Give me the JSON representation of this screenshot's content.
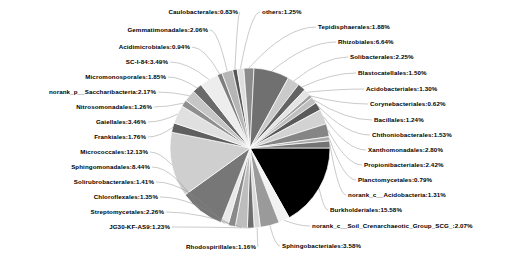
{
  "chart_data": {
    "type": "pie",
    "title": "",
    "subtitle": "",
    "xlabel": "",
    "ylabel": "",
    "legend_position": "none",
    "grid": false,
    "value_unit": "%",
    "start_angle_deg": 0,
    "direction": "clockwise",
    "palette": "grayscale",
    "categories": [
      "Burkholderiales",
      "norank_c__Soil_Crenarchaeotic_Group_SCG_",
      "Sphingobacteriales",
      "Rhodospirillales",
      "JG30-KF-AS9",
      "Streptomycetales",
      "Chloroflexales",
      "Solirubrobacterales",
      "Sphingomonadales",
      "Micrococcales",
      "Frankiales",
      "Gaiellales",
      "Nitrosomonadales",
      "norank_p__Saccharibacteria",
      "Micromonosporales",
      "SC-I-84",
      "Acidimicrobiales",
      "Gemmatimonadales",
      "Caulobacterales",
      "others",
      "Tepidisphaerales",
      "Rhizobiales",
      "Solibacterales",
      "Blastocatellales",
      "Acidobacteriales",
      "Corynebacteriales",
      "Bacillales",
      "Chthoniobacterales",
      "Xanthomonadales",
      "Propionibacteriales",
      "Planctomycetales",
      "norank_c__Acidobacteria"
    ],
    "values": [
      15.58,
      2.07,
      3.58,
      1.16,
      1.23,
      2.26,
      1.35,
      1.41,
      8.44,
      12.13,
      1.76,
      3.46,
      1.26,
      2.17,
      1.85,
      3.49,
      0.94,
      2.06,
      0.83,
      1.25,
      1.88,
      6.64,
      2.25,
      1.5,
      1.3,
      0.62,
      1.24,
      1.53,
      2.8,
      2.42,
      0.79,
      1.31
    ],
    "slices": [
      {
        "label": "Burkholderiales",
        "value": 15.58,
        "text": "Burkholderiales:15.58%",
        "color": "#000000"
      },
      {
        "label": "norank_c__Soil_Crenarchaeotic_Group_SCG_",
        "value": 2.07,
        "text": "norank_c__Soil_Crenarchaeotic_Group_SCG_:2.07%",
        "color": "#f2f2f2"
      },
      {
        "label": "Sphingobacteriales",
        "value": 3.58,
        "text": "Sphingobacteriales:3.58%",
        "color": "#9a9a9a"
      },
      {
        "label": "Rhodospirillales",
        "value": 1.16,
        "text": "Rhodospirillales:1.16%",
        "color": "#d8d8d8"
      },
      {
        "label": "JG30-KF-AS9",
        "value": 1.23,
        "text": "JG30-KF-AS9:1.23%",
        "color": "#6e6e6e"
      },
      {
        "label": "Streptomycetales",
        "value": 2.26,
        "text": "Streptomycetales:2.26%",
        "color": "#bdbdbd"
      },
      {
        "label": "Chloroflexales",
        "value": 1.35,
        "text": "Chloroflexales:1.35%",
        "color": "#8a8a8a"
      },
      {
        "label": "Solirubrobacterales",
        "value": 1.41,
        "text": "Solirubrobacterales:1.41%",
        "color": "#e8e8e8"
      },
      {
        "label": "Sphingomonadales",
        "value": 8.44,
        "text": "Sphingomonadales:8.44%",
        "color": "#777777"
      },
      {
        "label": "Micrococcales",
        "value": 12.13,
        "text": "Micrococcales:12.13%",
        "color": "#cfcfcf"
      },
      {
        "label": "Frankiales",
        "value": 1.76,
        "text": "Frankiales:1.76%",
        "color": "#5f5f5f"
      },
      {
        "label": "Gaiellales",
        "value": 3.46,
        "text": "Gaiellales:3.46%",
        "color": "#e0e0e0"
      },
      {
        "label": "Nitrosomonadales",
        "value": 1.26,
        "text": "Nitrosomonadales:1.26%",
        "color": "#8f8f8f"
      },
      {
        "label": "norank_p__Saccharibacteria",
        "value": 2.17,
        "text": "norank_p__Saccharibacteria:2.17%",
        "color": "#c6c6c6"
      },
      {
        "label": "Micromonosporales",
        "value": 1.85,
        "text": "Micromonosporales:1.85%",
        "color": "#6a6a6a"
      },
      {
        "label": "SC-I-84",
        "value": 3.49,
        "text": "SC-I-84:3.49%",
        "color": "#ededed"
      },
      {
        "label": "Acidimicrobiales",
        "value": 0.94,
        "text": "Acidimicrobiales:0.94%",
        "color": "#7e7e7e"
      },
      {
        "label": "Gemmatimonadales",
        "value": 2.06,
        "text": "Gemmatimonadales:2.06%",
        "color": "#b5b5b5"
      },
      {
        "label": "Caulobacterales",
        "value": 0.83,
        "text": "Caulobacterales:0.83%",
        "color": "#555555"
      },
      {
        "label": "others",
        "value": 1.25,
        "text": "others:1.25%",
        "color": "#dedede"
      },
      {
        "label": "Tepidisphaerales",
        "value": 1.88,
        "text": "Tepidisphaerales:1.88%",
        "color": "#8c8c8c"
      },
      {
        "label": "Rhizobiales",
        "value": 6.64,
        "text": "Rhizobiales:6.64%",
        "color": "#707070"
      },
      {
        "label": "Solibacterales",
        "value": 2.25,
        "text": "Solibacterales:2.25%",
        "color": "#cacaca"
      },
      {
        "label": "Blastocatellales",
        "value": 1.5,
        "text": "Blastocatellales:1.50%",
        "color": "#636363"
      },
      {
        "label": "Acidobacteriales",
        "value": 1.3,
        "text": "Acidobacteriales:1.30%",
        "color": "#e4e4e4"
      },
      {
        "label": "Corynebacteriales",
        "value": 0.62,
        "text": "Corynebacteriales:0.62%",
        "color": "#9e9e9e"
      },
      {
        "label": "Bacillales",
        "value": 1.24,
        "text": "Bacillales:1.24%",
        "color": "#bfbfbf"
      },
      {
        "label": "Chthoniobacterales",
        "value": 1.53,
        "text": "Chthoniobacterales:1.53%",
        "color": "#5a5a5a"
      },
      {
        "label": "Xanthomonadales",
        "value": 2.8,
        "text": "Xanthomonadales:2.80%",
        "color": "#d2d2d2"
      },
      {
        "label": "Propionibacteriales",
        "value": 2.42,
        "text": "Propionibacteriales:2.42%",
        "color": "#858585"
      },
      {
        "label": "Planctomycetales",
        "value": 0.79,
        "text": "Planctomycetales:0.79%",
        "color": "#ababab"
      },
      {
        "label": "norank_c__Acidobacteria",
        "value": 1.31,
        "text": "norank_c__Acidobacteria:1.31%",
        "color": "#747474"
      }
    ]
  },
  "labels": {
    "caulobacterales": "Caulobacterales:0.83%",
    "gemmatimonadales": "Gemmatimonadales:2.06%",
    "acidimicrobiales": "Acidimicrobiales:0.94%",
    "sc_i_84": "SC-I-84:3.49%",
    "micromonosporales": "Micromonosporales:1.85%",
    "saccharibacteria": "norank_p__Saccharibacteria:2.17%",
    "nitrosomonadales": "Nitrosomonadales:1.26%",
    "gaiellales": "Gaiellales:3.46%",
    "frankiales": "Frankiales:1.76%",
    "micrococcales": "Micrococcales:12.13%",
    "sphingomonadales": "Sphingomonadales:8.44%",
    "solirubrobacterales": "Solirubrobacterales:1.41%",
    "chloroflexales": "Chloroflexales:1.35%",
    "streptomycetales": "Streptomycetales:2.26%",
    "jg30_kf_as9": "JG30-KF-AS9:1.23%",
    "rhodospirillales": "Rhodospirillales:1.16%",
    "sphingobacteriales": "Sphingobacteriales:3.58%",
    "soil_crenarchaeotic": "norank_c__Soil_Crenarchaeotic_Group_SCG_:2.07%",
    "burkholderiales": "Burkholderiales:15.58%",
    "norank_acidobacteria": "norank_c__Acidobacteria:1.31%",
    "planctomycetales": "Planctomycetales:0.79%",
    "propionibacteriales": "Propionibacteriales:2.42%",
    "xanthomonadales": "Xanthomonadales:2.80%",
    "chthoniobacterales": "Chthoniobacterales:1.53%",
    "bacillales": "Bacillales:1.24%",
    "corynebacteriales": "Corynebacteriales:0.62%",
    "acidobacteriales": "Acidobacteriales:1.30%",
    "blastocatellales": "Blastocatellales:1.50%",
    "solibacterales": "Solibacterales:2.25%",
    "rhizobiales": "Rhizobiales:6.64%",
    "tepidisphaerales": "Tepidisphaerales:1.88%",
    "others": "others:1.25%"
  }
}
